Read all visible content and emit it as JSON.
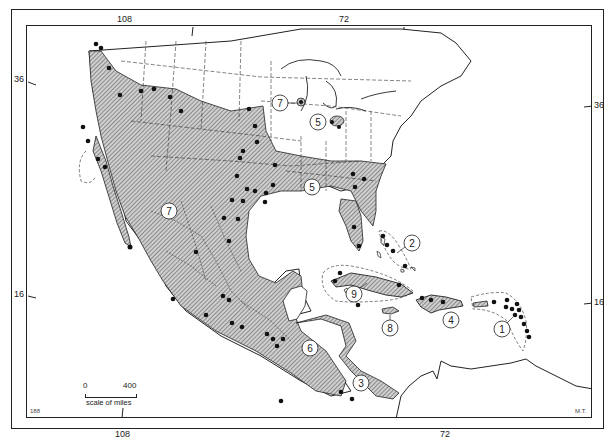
{
  "map": {
    "type": "species distribution map",
    "region": "North America, Central America and the Caribbean",
    "longitude_ticks": [
      {
        "label": "108",
        "position": "top"
      },
      {
        "label": "72",
        "position": "top"
      },
      {
        "label": "108",
        "position": "bottom"
      },
      {
        "label": "72",
        "position": "bottom"
      }
    ],
    "latitude_ticks": [
      {
        "label": "36",
        "position": "left"
      },
      {
        "label": "36",
        "position": "right"
      },
      {
        "label": "16",
        "position": "left"
      },
      {
        "label": "16",
        "position": "right"
      }
    ],
    "labels": {
      "top_108": "108",
      "top_72": "72",
      "bottom_108": "108",
      "bottom_72": "72",
      "left_36": "36",
      "right_36": "36",
      "left_16": "16",
      "right_16": "16"
    },
    "range_markers": [
      {
        "id": "1",
        "region": "Lesser Antilles"
      },
      {
        "id": "2",
        "region": "Bahamas"
      },
      {
        "id": "3",
        "region": "Costa Rica / Panama"
      },
      {
        "id": "4",
        "region": "Hispaniola"
      },
      {
        "id": "5",
        "region": "Southeastern United States"
      },
      {
        "id": "5",
        "region": "Ohio Valley outlier"
      },
      {
        "id": "6",
        "region": "Honduras / Nicaragua"
      },
      {
        "id": "7",
        "region": "Western US and Mexico"
      },
      {
        "id": "7",
        "region": "Great Lakes outlier"
      },
      {
        "id": "8",
        "region": "Jamaica"
      },
      {
        "id": "9",
        "region": "Cuba"
      }
    ],
    "marker_labels": {
      "m1": "1",
      "m2": "2",
      "m3": "3",
      "m4": "4",
      "m5a": "5",
      "m5b": "5",
      "m6": "6",
      "m7a": "7",
      "m7b": "7",
      "m8": "8",
      "m9": "9"
    },
    "scale_bar": {
      "start": "0",
      "end": "400",
      "caption": "scale of miles"
    },
    "corner_marks": {
      "bottom_left": "188",
      "bottom_right": "M.T."
    },
    "legend_styles": {
      "hatched_area": "distribution range",
      "dot": "collection locality",
      "dashed_outline": "island group range"
    },
    "colors": {
      "ink": "#1a1a1a",
      "paper": "#ffffff",
      "hatch": "#555555"
    }
  }
}
